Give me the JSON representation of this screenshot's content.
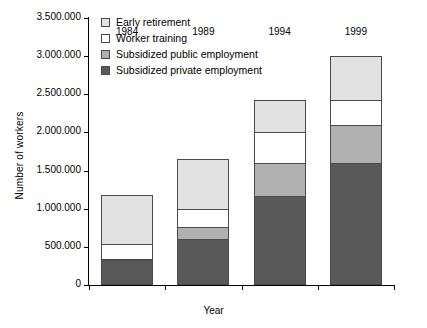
{
  "chart_data": {
    "type": "bar",
    "stacked": true,
    "title": "",
    "xlabel": "Year",
    "ylabel": "Number of workers",
    "categories": [
      "1984",
      "1989",
      "1994",
      "1999"
    ],
    "ylim": [
      0,
      3500000
    ],
    "ytick_values": [
      0,
      500000,
      1000000,
      1500000,
      2000000,
      2500000,
      3000000,
      3500000
    ],
    "ytick_labels": [
      "0",
      "500.000",
      "1.000.000",
      "1.500.000",
      "2.000.000",
      "2.500.000",
      "3.000.000",
      "3.500.000"
    ],
    "grid": false,
    "legend_position": "top-left",
    "series": [
      {
        "name": "Subsidized private employment",
        "color": "#595959",
        "values": [
          330000,
          600000,
          1170000,
          1600000
        ]
      },
      {
        "name": "Subsidized public employment",
        "color": "#b0b0b0",
        "values": [
          10000,
          160000,
          430000,
          500000
        ]
      },
      {
        "name": "Worker training",
        "color": "#ffffff",
        "values": [
          190000,
          240000,
          400000,
          330000
        ]
      },
      {
        "name": "Early retirement",
        "color": "#e2e2e2",
        "values": [
          650000,
          650000,
          420000,
          570000
        ]
      }
    ],
    "totals": [
      1180000,
      1650000,
      2420000,
      3000000
    ]
  }
}
